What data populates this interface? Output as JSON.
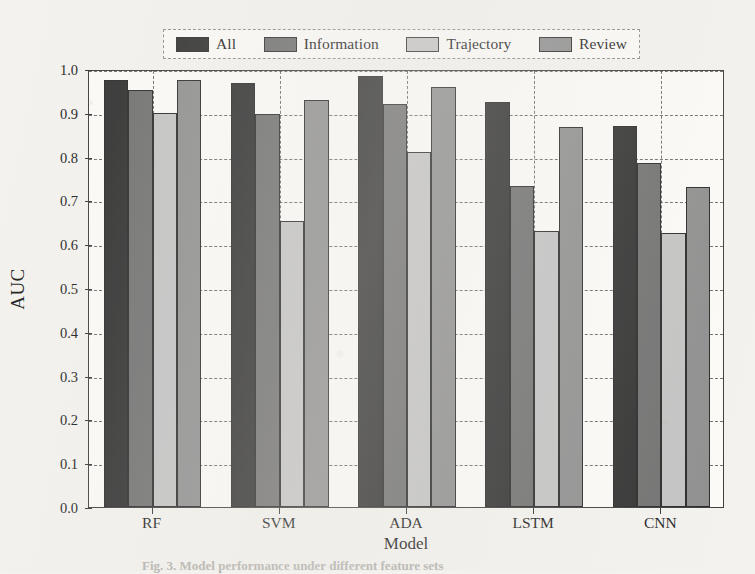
{
  "figure": {
    "caption": "Fig. 3. Model performance under different feature sets",
    "background_color": "#f3f2ee",
    "plot_background_color": "#fcfbf8",
    "frame_color": "#3b3b3b",
    "grid_color": "#4a4a4a"
  },
  "legend": {
    "position": "upper-center",
    "entries": [
      {
        "label": "All",
        "color": "#2e2e2e"
      },
      {
        "label": "Information",
        "color": "#6f6f6f"
      },
      {
        "label": "Trajectory",
        "color": "#c3c3c3"
      },
      {
        "label": "Review",
        "color": "#8e8e8e"
      }
    ]
  },
  "chart_data": {
    "type": "bar",
    "title": "",
    "xlabel": "Model",
    "ylabel": "AUC",
    "categories": [
      "RF",
      "SVM",
      "ADA",
      "LSTM",
      "CNN"
    ],
    "series": [
      {
        "name": "All",
        "color": "#2e2e2e",
        "values": [
          0.975,
          0.968,
          0.985,
          0.925,
          0.87
        ]
      },
      {
        "name": "Information",
        "color": "#6f6f6f",
        "values": [
          0.953,
          0.898,
          0.92,
          0.732,
          0.785
        ]
      },
      {
        "name": "Trajectory",
        "color": "#c3c3c3",
        "values": [
          0.9,
          0.652,
          0.81,
          0.63,
          0.625
        ]
      },
      {
        "name": "Review",
        "color": "#8e8e8e",
        "values": [
          0.975,
          0.93,
          0.96,
          0.867,
          0.73
        ]
      }
    ],
    "ylim": [
      0.0,
      1.0
    ],
    "yticks": [
      "0.0",
      "0.1",
      "0.2",
      "0.3",
      "0.4",
      "0.5",
      "0.6",
      "0.7",
      "0.8",
      "0.9",
      "1.0"
    ],
    "ytick_values": [
      0.0,
      0.1,
      0.2,
      0.3,
      0.4,
      0.5,
      0.6,
      0.7,
      0.8,
      0.9,
      1.0
    ],
    "grid": true,
    "grid_style": "dashed",
    "legend_position": "upper center"
  }
}
